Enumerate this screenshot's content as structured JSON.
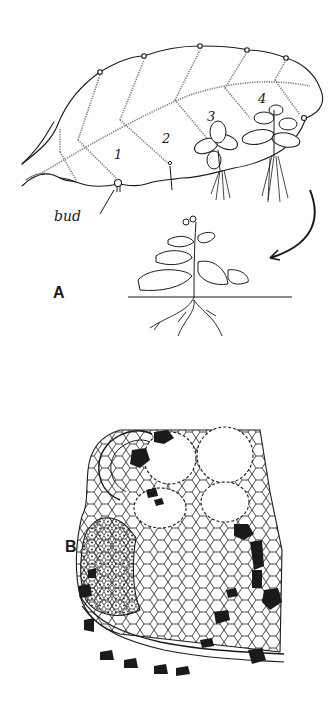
{
  "figure": {
    "panels": [
      {
        "id": "A",
        "label": "A",
        "description": "Leaf with plantlets developing at marginal notches, and a detached plantlet growing in soil",
        "stage_labels": [
          "1",
          "2",
          "3",
          "4"
        ],
        "annotation": "bud"
      },
      {
        "id": "B",
        "label": "B",
        "description": "Cellular cross-section of a leaf notch showing meristematic bud tissue"
      }
    ]
  },
  "colors": {
    "ink": "#1a1a1a",
    "background": "#ffffff",
    "stipple": "#7a7a7a"
  }
}
